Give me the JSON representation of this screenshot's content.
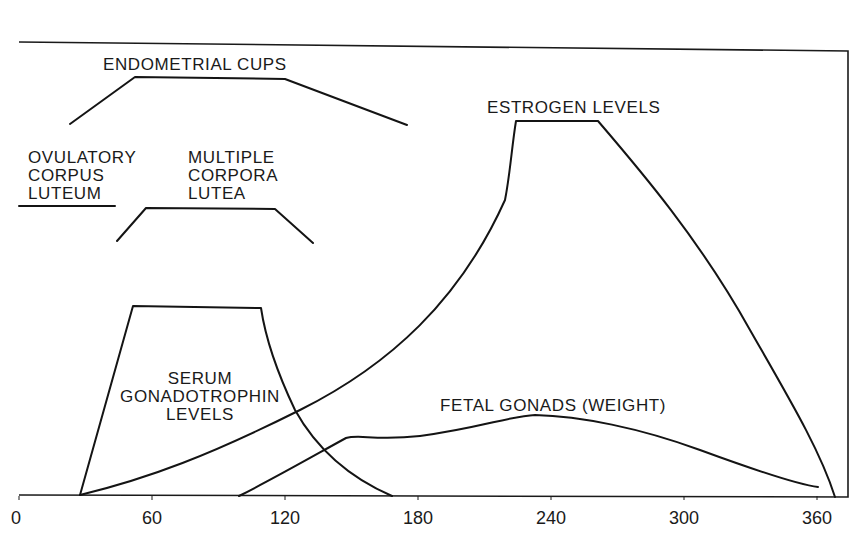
{
  "chart_data": {
    "type": "line",
    "title": "",
    "xlabel": "",
    "ylabel": "",
    "x_unit": "days of gestation",
    "xlim": [
      0,
      370
    ],
    "ylim": [
      0,
      100
    ],
    "grid": false,
    "legend": "inline labels",
    "x_ticks": [
      0,
      60,
      120,
      180,
      240,
      300,
      360
    ],
    "x_tick_labels": [
      "0",
      "60",
      "120",
      "180",
      "240",
      "300",
      "360"
    ],
    "series": [
      {
        "name": "ENDOMETRIAL CUPS",
        "label_lines": [
          "ENDOMETRIAL CUPS"
        ],
        "x": [
          23,
          53,
          120,
          175
        ],
        "y": [
          77,
          87,
          87,
          77
        ]
      },
      {
        "name": "OVULATORY CORPUS LUTEUM",
        "label_lines": [
          "OVULATORY",
          "CORPUS",
          "LUTEUM"
        ],
        "x": [
          0,
          43
        ],
        "y": [
          60,
          60
        ]
      },
      {
        "name": "MULTIPLE CORPORA LUTEA",
        "label_lines": [
          "MULTIPLE",
          "CORPORA",
          "LUTEA"
        ],
        "x": [
          44,
          57,
          116,
          131
        ],
        "y": [
          53,
          60,
          60,
          53
        ]
      },
      {
        "name": "SERUM GONADOTROPHIN LEVELS",
        "label_lines": [
          "SERUM",
          "GONADOTROPHIN",
          "LEVELS"
        ],
        "x": [
          27,
          51,
          109,
          115,
          130,
          150,
          168
        ],
        "y": [
          0,
          39,
          39,
          28,
          15,
          6,
          0
        ]
      },
      {
        "name": "ESTROGEN LEVELS",
        "label_lines": [
          "ESTROGEN LEVELS"
        ],
        "x": [
          28,
          60,
          100,
          140,
          180,
          210,
          222,
          226,
          264,
          300,
          330,
          350,
          360,
          365
        ],
        "y": [
          0,
          5,
          13,
          24,
          42,
          62,
          76,
          78,
          78,
          60,
          40,
          20,
          10,
          0
        ]
      },
      {
        "name": "FETAL GONADS (WEIGHT)",
        "label_lines": [
          "FETAL GONADS (WEIGHT)"
        ],
        "x": [
          99,
          130,
          148,
          155,
          180,
          210,
          235,
          260,
          300,
          360
        ],
        "y": [
          0,
          9,
          12,
          12,
          13,
          16,
          17,
          16,
          12,
          2
        ]
      }
    ]
  },
  "svg": {
    "frame_points": "19,42 848,51 848,497 19,495",
    "ticks": [
      {
        "label": "0",
        "x": 19,
        "lx": 11
      },
      {
        "label": "60",
        "x": 152,
        "lx": 152
      },
      {
        "label": "120",
        "x": 285,
        "lx": 285
      },
      {
        "label": "180",
        "x": 418,
        "lx": 418
      },
      {
        "label": "240",
        "x": 551,
        "lx": 551
      },
      {
        "label": "300",
        "x": 684,
        "lx": 684
      },
      {
        "label": "360",
        "x": 817,
        "lx": 817
      }
    ],
    "paths": {
      "endometrial_cups": "M70,124 L135,77 L285,79 L407,125",
      "ovulatory_cl": "M19,206 L115,206",
      "multiple_cl": "M117,241 L146,208 L275,209 L313,243",
      "gonadotrophin": "M80,495 L133,306 L261,308 C265,335 275,368 295,410 C320,455 355,480 392,496",
      "estrogen": "M80,495 C150,478 210,455 300,410 C390,365 460,300 505,200 C510,175 512,145 516,121 L598,121 C640,170 700,240 750,330 C790,400 820,450 835,497",
      "fetal_gonads": "M239,496 C275,478 315,455 346,438 C360,434 375,441 420,436 C480,428 510,416 535,415 C580,416 640,428 700,450 C760,472 800,485 818,487"
    },
    "labels": [
      {
        "key": "endo",
        "x": 103,
        "y": 70,
        "anchor": "start"
      },
      {
        "key": "ocl1",
        "x": 28,
        "y": 163,
        "anchor": "start"
      },
      {
        "key": "ocl2",
        "x": 28,
        "y": 181,
        "anchor": "start"
      },
      {
        "key": "ocl3",
        "x": 28,
        "y": 199,
        "anchor": "start"
      },
      {
        "key": "mcl1",
        "x": 188,
        "y": 163,
        "anchor": "start"
      },
      {
        "key": "mcl2",
        "x": 188,
        "y": 181,
        "anchor": "start"
      },
      {
        "key": "mcl3",
        "x": 188,
        "y": 199,
        "anchor": "start"
      },
      {
        "key": "gon1",
        "x": 200,
        "y": 384,
        "anchor": "middle"
      },
      {
        "key": "gon2",
        "x": 200,
        "y": 402,
        "anchor": "middle"
      },
      {
        "key": "gon3",
        "x": 200,
        "y": 420,
        "anchor": "middle"
      },
      {
        "key": "est",
        "x": 487,
        "y": 113,
        "anchor": "start"
      },
      {
        "key": "fet",
        "x": 440,
        "y": 411,
        "anchor": "start"
      }
    ]
  },
  "labels": {
    "endo": "ENDOMETRIAL CUPS",
    "ocl1": "OVULATORY",
    "ocl2": "CORPUS",
    "ocl3": "LUTEUM",
    "mcl1": "MULTIPLE",
    "mcl2": "CORPORA",
    "mcl3": "LUTEA",
    "gon1": "SERUM",
    "gon2": "GONADOTROPHIN",
    "gon3": "LEVELS",
    "est": "ESTROGEN LEVELS",
    "fet": "FETAL GONADS (WEIGHT)"
  }
}
